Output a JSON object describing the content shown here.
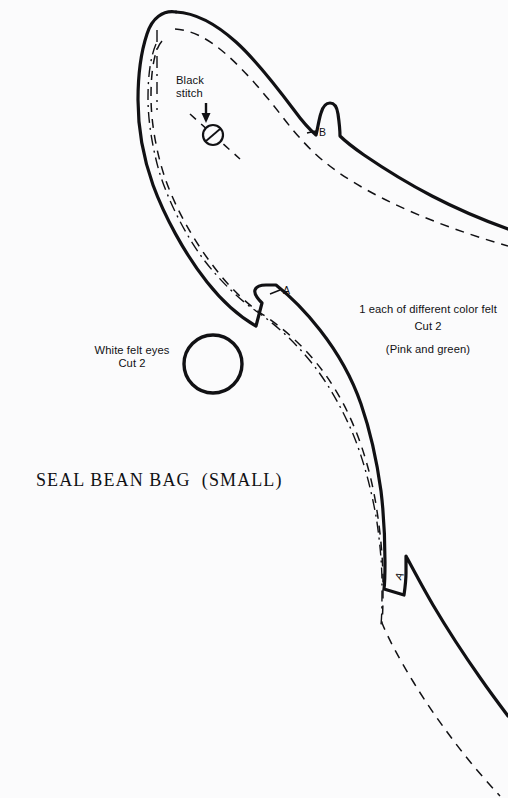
{
  "page": {
    "background_color": "#fbfbfc",
    "ink_color": "#111114",
    "width": 508,
    "height": 798
  },
  "title": "SEAL BEAN BAG  (SMALL)",
  "labels": {
    "black_stitch": "Black\nstitch",
    "material_note_line1": "1 each of different color felt",
    "material_note_line2": "(Pink and green)",
    "material_cut": "Cut 2",
    "white_felt_eyes": "White felt eyes\nCut 2"
  },
  "notch_markers": {
    "b": "B",
    "a_upper": "A",
    "a_lower": "A"
  },
  "icons": {
    "arrow": "stitch-arrow-icon",
    "eye": "eye-circle-icon",
    "stitch_dot": "stitch-marker-icon"
  },
  "pattern": {
    "name": "seal-bean-bag-small",
    "outline_stroke_width": 3.2,
    "seam_dash_pattern": "9 7",
    "fold_dashdot_pattern": "11 5 2 5",
    "outline_path": "M 176 12 C 163 10 152 18 147 34 C 141 52 138 76 138 100 C 138 126 143 157 153 185 C 164 215 184 253 207 282 C 222 301 240 317 256 326 L 262 303 C 256 297 254 293 255 290 C 256 287 260 285 266 285 L 276 285 C 290 296 306 312 320 330 C 338 353 352 378 361 404 C 371 433 377 462 381 491 C 384 516 385 541 385 562 C 385 574 385 582 384 589 L 404 595 C 405 588 406 580 406 573 C 406 566 406 560 406 556 C 414 571 423 588 433 605 C 446 627 462 652 481 679 C 490 692 499 704 508 716",
    "outline_top_path": "M 176 12 C 196 13 216 24 236 42 C 256 60 276 86 294 110 C 302 121 309 129 316 135 C 318 127 319 119 321 113 C 323 106 326 103 330 103 C 334 103 337 107 338 114 C 339 121 340 128 340 136 C 346 142 354 148 364 155 C 383 168 407 183 432 196 C 457 209 483 220 508 229",
    "seam_dashed_path": "M 175 29 C 192 30 209 39 227 55 C 245 71 264 93 281 115 C 297 136 312 152 326 163 C 342 176 362 188 384 199 C 406 210 430 220 455 229 C 472 235 490 241 508 246",
    "seam_dashed_lower_path": "M 162 41 C 154 50 151 72 151 96 C 151 122 156 151 165 178 C 175 207 193 240 214 267 C 230 288 247 304 262 314 C 280 326 298 341 314 360 C 331 380 345 404 355 429 C 366 456 373 484 377 511 C 381 537 383 562 383 582 C 383 598 383 612 382 623 C 389 640 400 660 414 683 C 428 706 445 730 463 753 C 475 768 488 783 500 796",
    "fold_dashdot_path": "M 156 44 C 150 58 148 78 148 98 C 148 120 152 146 159 171 C 168 200 184 233 204 260 C 221 282 240 300 256 311 C 275 324 294 341 311 362 C 328 383 342 408 353 434 C 364 461 371 489 376 516 C 380 541 382 565 382 584 C 382 600 382 614 381 625",
    "fold_short_path": "M 157 30 L 157 110",
    "stitch_dash_path": "M 190 114 L 240 159",
    "eye_circle": {
      "cx": 213,
      "cy": 364,
      "r": 29,
      "stroke_width": 3.4
    },
    "stitch_circle": {
      "cx": 213,
      "cy": 135,
      "r": 10,
      "stroke_width": 2.2
    },
    "stitch_tick": {
      "x1": 206,
      "y1": 141,
      "x2": 220,
      "y2": 129
    },
    "arrow": {
      "x": 206,
      "y_top": 104,
      "y_bottom": 122
    }
  }
}
